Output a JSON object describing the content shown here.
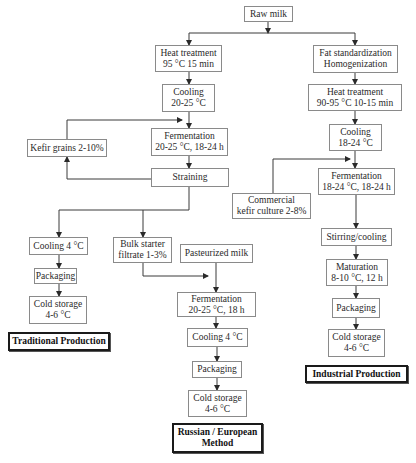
{
  "diagram": {
    "type": "flowchart",
    "nodes": {
      "raw_milk": {
        "lines": [
          "Raw milk"
        ]
      },
      "heat_treatment_trad": {
        "lines": [
          "Heat treatment",
          "95 °C 15 min"
        ]
      },
      "cooling_trad_1": {
        "lines": [
          "Cooling",
          "20-25 °C"
        ]
      },
      "kefir_grains": {
        "lines": [
          "Kefir grains 2-10%"
        ]
      },
      "fermentation_trad": {
        "lines": [
          "Fermentation",
          "20-25 °C, 18-24 h"
        ]
      },
      "straining": {
        "lines": [
          "Straining"
        ]
      },
      "cooling_trad_2": {
        "lines": [
          "Cooling 4 °C"
        ]
      },
      "packaging_trad": {
        "lines": [
          "Packaging"
        ]
      },
      "cold_storage_trad": {
        "lines": [
          "Cold storage",
          "4-6 °C"
        ]
      },
      "label_traditional": {
        "lines": [
          "Traditional Production"
        ]
      },
      "bulk_starter": {
        "lines": [
          "Bulk starter",
          "filtrate 1-3%"
        ]
      },
      "pasteurized_milk": {
        "lines": [
          "Pasteurized milk"
        ]
      },
      "fermentation_rus": {
        "lines": [
          "Fermentation",
          "20-25 °C, 18 h"
        ]
      },
      "cooling_rus": {
        "lines": [
          "Cooling 4 °C"
        ]
      },
      "packaging_rus": {
        "lines": [
          "Packaging"
        ]
      },
      "cold_storage_rus": {
        "lines": [
          "Cold storage",
          "4-6 °C"
        ]
      },
      "label_russian": {
        "lines": [
          "Russian / European",
          "Method"
        ]
      },
      "fat_std": {
        "lines": [
          "Fat standardization",
          "Homogenization"
        ]
      },
      "heat_treatment_ind": {
        "lines": [
          "Heat treatment",
          "90-95 °C 10-15 min"
        ]
      },
      "cooling_ind": {
        "lines": [
          "Cooling",
          "18-24 °C"
        ]
      },
      "commercial_culture": {
        "lines": [
          "Commercial",
          "kefir culture 2-8%"
        ]
      },
      "fermentation_ind": {
        "lines": [
          "Fermentation",
          "18-24 °C, 18-24 h"
        ]
      },
      "stirring_cooling": {
        "lines": [
          "Stirring/cooling"
        ]
      },
      "maturation": {
        "lines": [
          "Maturation",
          "8-10 °C, 12 h"
        ]
      },
      "packaging_ind": {
        "lines": [
          "Packaging"
        ]
      },
      "cold_storage_ind": {
        "lines": [
          "Cold storage",
          "4-6 °C"
        ]
      },
      "label_industrial": {
        "lines": [
          "Industrial Production"
        ]
      }
    },
    "edges": [
      [
        "raw_milk",
        "heat_treatment_trad"
      ],
      [
        "raw_milk",
        "fat_std"
      ],
      [
        "heat_treatment_trad",
        "cooling_trad_1"
      ],
      [
        "cooling_trad_1",
        "fermentation_trad"
      ],
      [
        "kefir_grains",
        "fermentation_trad"
      ],
      [
        "fermentation_trad",
        "straining"
      ],
      [
        "straining",
        "kefir_grains"
      ],
      [
        "straining",
        "cooling_trad_2"
      ],
      [
        "straining",
        "bulk_starter"
      ],
      [
        "cooling_trad_2",
        "packaging_trad"
      ],
      [
        "packaging_trad",
        "cold_storage_trad"
      ],
      [
        "bulk_starter",
        "fermentation_rus"
      ],
      [
        "pasteurized_milk",
        "fermentation_rus"
      ],
      [
        "fermentation_rus",
        "cooling_rus"
      ],
      [
        "cooling_rus",
        "packaging_rus"
      ],
      [
        "packaging_rus",
        "cold_storage_rus"
      ],
      [
        "fat_std",
        "heat_treatment_ind"
      ],
      [
        "heat_treatment_ind",
        "cooling_ind"
      ],
      [
        "cooling_ind",
        "fermentation_ind"
      ],
      [
        "commercial_culture",
        "fermentation_ind"
      ],
      [
        "fermentation_ind",
        "stirring_cooling"
      ],
      [
        "stirring_cooling",
        "maturation"
      ],
      [
        "maturation",
        "packaging_ind"
      ],
      [
        "packaging_ind",
        "cold_storage_ind"
      ]
    ]
  }
}
